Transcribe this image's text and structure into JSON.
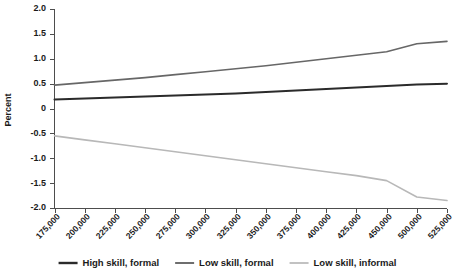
{
  "chart_data": {
    "type": "line",
    "title": "",
    "xlabel": "",
    "ylabel": "Percent",
    "ylim": [
      -2.0,
      2.0
    ],
    "ytick_labels": [
      "2.0",
      "1.5",
      "1.0",
      "0.5",
      "0",
      "-0.5",
      "-1.0",
      "-1.5",
      "-2.0"
    ],
    "ytick_values": [
      2.0,
      1.5,
      1.0,
      0.5,
      0,
      -0.5,
      -1.0,
      -1.5,
      -2.0
    ],
    "grid": false,
    "legend_position": "bottom",
    "categories": [
      "175,000",
      "200,000",
      "225,000",
      "250,000",
      "275,000",
      "300,000",
      "325,000",
      "350,000",
      "375,000",
      "400,000",
      "425,000",
      "450,000",
      "500,000",
      "525,000"
    ],
    "x": [
      175000,
      200000,
      225000,
      250000,
      275000,
      300000,
      325000,
      350000,
      375000,
      400000,
      425000,
      450000,
      500000,
      525000
    ],
    "series": [
      {
        "name": "High skill, formal",
        "color": "#2b2b2b",
        "width": 2.0,
        "values": [
          0.18,
          0.2,
          0.22,
          0.24,
          0.26,
          0.28,
          0.3,
          0.33,
          0.36,
          0.39,
          0.42,
          0.45,
          0.48,
          0.5
        ]
      },
      {
        "name": "Low skill, formal",
        "color": "#676767",
        "width": 1.6,
        "values": [
          0.47,
          0.52,
          0.57,
          0.62,
          0.68,
          0.74,
          0.8,
          0.86,
          0.93,
          1.0,
          1.07,
          1.14,
          1.3,
          1.35
        ]
      },
      {
        "name": "Low skill, informal",
        "color": "#b8b8b8",
        "width": 1.6,
        "values": [
          -0.55,
          -0.63,
          -0.71,
          -0.79,
          -0.87,
          -0.95,
          -1.03,
          -1.11,
          -1.19,
          -1.27,
          -1.35,
          -1.45,
          -1.78,
          -1.85
        ]
      }
    ]
  },
  "legend": {
    "items": [
      {
        "label": "High skill, formal",
        "color": "#2b2b2b"
      },
      {
        "label": "Low skill, formal",
        "color": "#676767"
      },
      {
        "label": "Low skill, informal",
        "color": "#b8b8b8"
      }
    ]
  }
}
